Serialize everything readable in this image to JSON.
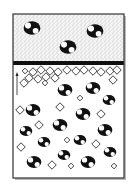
{
  "figure": {
    "colors": {
      "frame": "#333333",
      "band": "#111111",
      "particle": "#111111",
      "particle_highlight": "#ffffff",
      "stipple_bg": "#dddddd",
      "lower_bg": "#ffffff",
      "diamond_stroke": "#222222"
    },
    "upper_layer": {
      "texture": "stippled",
      "particles": [
        {
          "x": 32,
          "y": 28,
          "r": 8
        },
        {
          "x": 95,
          "y": 31,
          "r": 8
        },
        {
          "x": 68,
          "y": 47,
          "r": 8
        }
      ]
    },
    "separator": {
      "y": 61,
      "height": 4
    },
    "lower_layer": {
      "arrow": "up-arrow",
      "particles": [
        {
          "x": 65,
          "y": 90,
          "r": 7
        },
        {
          "x": 93,
          "y": 88,
          "r": 7
        },
        {
          "x": 33,
          "y": 110,
          "r": 7
        },
        {
          "x": 83,
          "y": 114,
          "r": 7
        },
        {
          "x": 109,
          "y": 100,
          "r": 6
        },
        {
          "x": 60,
          "y": 125,
          "r": 7
        },
        {
          "x": 26,
          "y": 131,
          "r": 6
        },
        {
          "x": 105,
          "y": 130,
          "r": 7
        },
        {
          "x": 44,
          "y": 142,
          "r": 6
        },
        {
          "x": 80,
          "y": 140,
          "r": 6
        },
        {
          "x": 64,
          "y": 155,
          "r": 6
        },
        {
          "x": 34,
          "y": 162,
          "r": 7
        },
        {
          "x": 88,
          "y": 162,
          "r": 7
        },
        {
          "x": 110,
          "y": 152,
          "r": 6
        }
      ],
      "diamonds": [
        {
          "x": 25,
          "y": 71,
          "s": 2
        },
        {
          "x": 33,
          "y": 72,
          "s": 3
        },
        {
          "x": 41,
          "y": 70,
          "s": 3
        },
        {
          "x": 50,
          "y": 71,
          "s": 3
        },
        {
          "x": 58,
          "y": 72,
          "s": 3
        },
        {
          "x": 67,
          "y": 70,
          "s": 3
        },
        {
          "x": 76,
          "y": 71,
          "s": 3
        },
        {
          "x": 84,
          "y": 70,
          "s": 3
        },
        {
          "x": 93,
          "y": 71,
          "s": 3
        },
        {
          "x": 101,
          "y": 72,
          "s": 3
        },
        {
          "x": 110,
          "y": 71,
          "s": 3
        },
        {
          "x": 117,
          "y": 70,
          "s": 3
        },
        {
          "x": 29,
          "y": 78,
          "s": 3
        },
        {
          "x": 38,
          "y": 79,
          "s": 3
        },
        {
          "x": 46,
          "y": 77,
          "s": 3
        },
        {
          "x": 55,
          "y": 78,
          "s": 3
        },
        {
          "x": 24,
          "y": 83,
          "s": 3
        },
        {
          "x": 45,
          "y": 83,
          "s": 2
        },
        {
          "x": 113,
          "y": 80,
          "s": 3
        },
        {
          "x": 20,
          "y": 110,
          "s": 3
        },
        {
          "x": 60,
          "y": 107,
          "s": 3
        },
        {
          "x": 101,
          "y": 114,
          "s": 3
        },
        {
          "x": 39,
          "y": 125,
          "s": 3
        },
        {
          "x": 67,
          "y": 140,
          "s": 2
        },
        {
          "x": 96,
          "y": 144,
          "s": 3
        },
        {
          "x": 21,
          "y": 147,
          "s": 3
        },
        {
          "x": 52,
          "y": 165,
          "s": 3
        },
        {
          "x": 71,
          "y": 166,
          "s": 2
        },
        {
          "x": 114,
          "y": 166,
          "s": 2
        },
        {
          "x": 80,
          "y": 98,
          "s": 2
        }
      ]
    },
    "caption": ""
  }
}
